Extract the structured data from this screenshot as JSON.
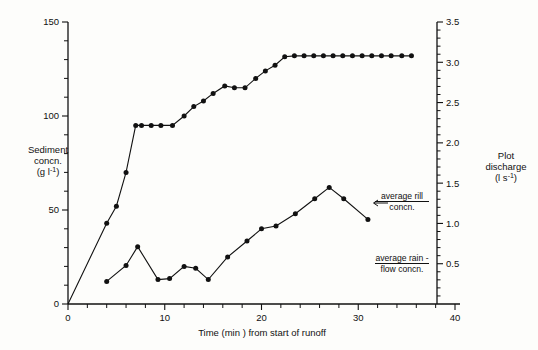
{
  "chart_data": {
    "type": "line",
    "title": "",
    "xlabel": "Time (min ) from start of runoff",
    "ylabel": "Sediment concn. (g l-1)",
    "ylabel_right": "Plot discharge (l s-1)",
    "xlim": [
      0,
      40
    ],
    "ylim": [
      0,
      150
    ],
    "ylim_right": [
      0,
      3.5
    ],
    "xticks": [
      0,
      10,
      20,
      30,
      40
    ],
    "xticklabels": [
      "0",
      "10",
      "20",
      "30",
      "40"
    ],
    "yticks": [
      0,
      50,
      100,
      150
    ],
    "yticklabels": [
      "0",
      "50",
      "100",
      "150"
    ],
    "yticks_minor": [
      10,
      20,
      30,
      40,
      60,
      70,
      80,
      90,
      110,
      120,
      130,
      140
    ],
    "yticks_right": [
      0.5,
      1.0,
      1.5,
      2.0,
      2.5,
      3.0,
      3.5
    ],
    "yticklabels_right": [
      "0.5",
      "1.0",
      "1.5",
      "2.0",
      "2.5",
      "3.0",
      "3.5"
    ],
    "grid": false,
    "legend": "none",
    "marker": "filled-circle",
    "series": [
      {
        "name": "average rill concn.",
        "axis": "left",
        "x": [
          0,
          4.0,
          5.0,
          6.0,
          7.0,
          7.6,
          8.6,
          9.6,
          10.8,
          12.0,
          13.0,
          14.0,
          15.0,
          16.2,
          17.2,
          18.3,
          19.4,
          20.4,
          21.4,
          22.4,
          23.4,
          24.4,
          25.4,
          26.4,
          27.4,
          28.4,
          29.4,
          30.4,
          31.4,
          32.4,
          33.4,
          34.5,
          35.5
        ],
        "y": [
          0,
          43.0,
          52.0,
          70.0,
          95.0,
          95.0,
          95.0,
          95.0,
          95.0,
          100.0,
          105.0,
          108.0,
          112.0,
          116.0,
          115.0,
          115.0,
          120.0,
          124.0,
          127.0,
          131.5,
          132.0,
          132.0,
          132.0,
          132.0,
          132.0,
          132.0,
          132.0,
          132.0,
          132.0,
          132.0,
          132.0,
          132.0,
          132.0
        ]
      },
      {
        "name": "average rain-flow concn.",
        "axis": "left",
        "x": [
          4.0,
          6.0,
          7.2,
          9.3,
          10.5,
          12.0,
          13.2,
          14.5,
          16.5,
          18.5,
          20.0,
          21.5,
          23.5,
          25.5,
          27.0,
          28.5,
          31.0
        ],
        "y": [
          12.0,
          20.5,
          30.5,
          13.0,
          13.5,
          20.0,
          19.0,
          13.0,
          25.0,
          33.5,
          40.0,
          41.5,
          48.0,
          56.0,
          62.0,
          56.0,
          45.0
        ]
      }
    ],
    "annotations": [
      {
        "id": "rill",
        "line1": "average rill",
        "line2": "concn.",
        "arrow": "left"
      },
      {
        "id": "rainflow",
        "line1": "average rain -",
        "line2": "flow concn.",
        "arrow": "none"
      }
    ]
  },
  "axes": {
    "left": {
      "title_line1": "Sediment",
      "title_line2": "concn.",
      "title_line3_pre": "(g l",
      "title_line3_sup": "-1",
      "title_line3_post": ")"
    },
    "right": {
      "title_line1": "Plot",
      "title_line2": "discharge",
      "title_line3_pre": "(l s",
      "title_line3_sup": "-1",
      "title_line3_post": ")"
    },
    "bottom": {
      "title": "Time (min ) from start of runoff"
    }
  }
}
